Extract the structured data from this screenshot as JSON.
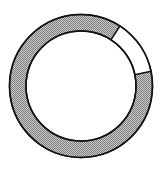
{
  "chart_data": {
    "type": "pie",
    "variant": "donut",
    "title": "",
    "categories": [
      "filled",
      "empty"
    ],
    "values": [
      87.5,
      12.5
    ],
    "segments": [
      {
        "name": "filled",
        "start_deg": 78,
        "end_deg": 393,
        "fill": "hatched-gray"
      },
      {
        "name": "empty",
        "start_deg": 33,
        "end_deg": 78,
        "fill": "#ffffff"
      }
    ],
    "legend": [],
    "annotations": []
  },
  "style": {
    "fill_color": "#b0b0b0",
    "hatch_color": "#7a7a7a",
    "stroke_color": "#111111",
    "empty_color": "#ffffff"
  },
  "geometry": {
    "cx": 81,
    "cy": 86,
    "r_outer": 71.5,
    "r_inner": 55
  }
}
